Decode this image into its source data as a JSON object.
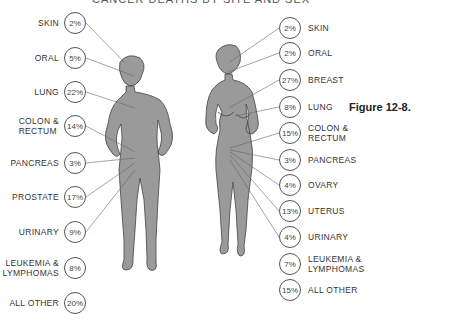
{
  "title": "CANCER DEATHS BY SITE AND SEX",
  "figure_label": "Figure 12-8.",
  "male": {
    "items": [
      {
        "label": "SKIN",
        "pct": "2%"
      },
      {
        "label": "ORAL",
        "pct": "5%"
      },
      {
        "label": "LUNG",
        "pct": "22%"
      },
      {
        "label": "COLON &\nRECTUM",
        "pct": "14%"
      },
      {
        "label": "PANCREAS",
        "pct": "3%"
      },
      {
        "label": "PROSTATE",
        "pct": "17%"
      },
      {
        "label": "URINARY",
        "pct": "9%"
      },
      {
        "label": "LEUKEMIA &\nLYMPHOMAS",
        "pct": "8%"
      },
      {
        "label": "ALL OTHER",
        "pct": "20%"
      }
    ]
  },
  "female": {
    "items": [
      {
        "label": "SKIN",
        "pct": "2%"
      },
      {
        "label": "ORAL",
        "pct": "2%"
      },
      {
        "label": "BREAST",
        "pct": "27%"
      },
      {
        "label": "LUNG",
        "pct": "8%"
      },
      {
        "label": "COLON &\nRECTUM",
        "pct": "15%"
      },
      {
        "label": "PANCREAS",
        "pct": "3%"
      },
      {
        "label": "OVARY",
        "pct": "4%"
      },
      {
        "label": "UTERUS",
        "pct": "13%"
      },
      {
        "label": "URINARY",
        "pct": "4%"
      },
      {
        "label": "LEUKEMIA &\nLYMPHOMAS",
        "pct": "7%"
      },
      {
        "label": "ALL OTHER",
        "pct": "15%"
      }
    ]
  },
  "colors": {
    "body_fill": "#9a9a9a",
    "outline": "#444444",
    "line": "#666666"
  }
}
